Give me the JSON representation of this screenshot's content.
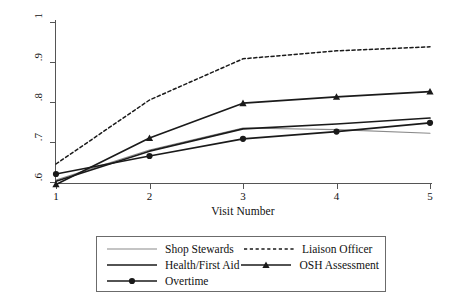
{
  "chart_data": {
    "type": "line",
    "title": "",
    "xlabel": "Visit Number",
    "ylabel": "Average Compliance",
    "x": [
      1,
      2,
      3,
      4,
      5
    ],
    "xtick_labels": [
      "1",
      "2",
      "3",
      "4",
      "5"
    ],
    "ytick_labels": [
      "1",
      ".9",
      ".8",
      ".7",
      ".6"
    ],
    "ytick_values": [
      1,
      0.9,
      0.8,
      0.7,
      0.6
    ],
    "xlim": [
      1,
      5
    ],
    "ylim": [
      0.6,
      1.0
    ],
    "grid": false,
    "legend_position": "below-plot",
    "series": [
      {
        "name": "Shop Stewards",
        "values": [
          0.605,
          0.68,
          0.735,
          0.731,
          0.722
        ],
        "style": "solid-thin",
        "color": "#8a8a8a",
        "marker": "none"
      },
      {
        "name": "Liaison Officer",
        "values": [
          0.645,
          0.805,
          0.908,
          0.928,
          0.938
        ],
        "style": "dashed",
        "color": "#1a1a1a",
        "marker": "none"
      },
      {
        "name": "Health/First Aid",
        "values": [
          0.602,
          0.677,
          0.733,
          0.745,
          0.76
        ],
        "style": "solid-thick",
        "color": "#1a1a1a",
        "marker": "none"
      },
      {
        "name": "OSH Assessment",
        "values": [
          0.594,
          0.71,
          0.797,
          0.813,
          0.826
        ],
        "style": "solid-thick",
        "color": "#1a1a1a",
        "marker": "triangle"
      },
      {
        "name": "Overtime",
        "values": [
          0.62,
          0.665,
          0.708,
          0.726,
          0.748
        ],
        "style": "solid-thick",
        "color": "#1a1a1a",
        "marker": "circle"
      }
    ]
  },
  "axes": {
    "y_title": "Average Compliance",
    "x_title": "Visit Number"
  },
  "legend": {
    "rows": [
      [
        {
          "label": "Shop Stewards",
          "key": "line-thin-key"
        },
        {
          "label": "Liaison Officer",
          "key": "line-dashed-key"
        }
      ],
      [
        {
          "label": "Health/First Aid",
          "key": "line-thick-key"
        },
        {
          "label": "OSH Assessment",
          "key": "line-triangle-key"
        }
      ],
      [
        {
          "label": "Overtime",
          "key": "line-circle-key"
        },
        {
          "label": "",
          "key": ""
        }
      ]
    ]
  },
  "colors": {
    "axis": "#555555",
    "text": "#111111",
    "series_dark": "#1a1a1a",
    "series_gray": "#8a8a8a",
    "legend_border": "#6b6b6b",
    "background": "#ffffff"
  }
}
